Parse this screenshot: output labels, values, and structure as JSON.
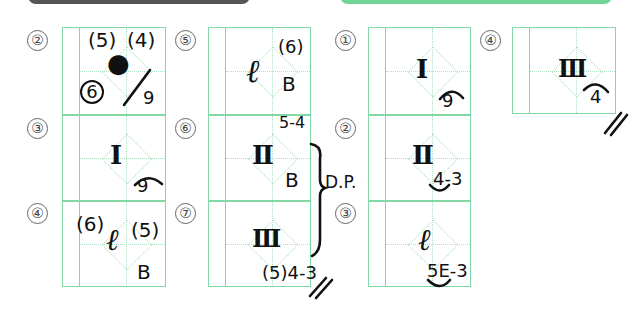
{
  "header_bars": {
    "left_color": "#555555",
    "right_color": "#6fd695"
  },
  "grid_color": "#7fd8a6",
  "left_answers": [
    {
      "number": "②",
      "main": "●",
      "top_left": "(5)",
      "top_right": "(4)",
      "circled": "6",
      "slash": "/",
      "bottom": "9"
    },
    {
      "number": "③",
      "main": "I",
      "bottom": "9",
      "arc": "⌒"
    },
    {
      "number": "④",
      "main": "ℓ",
      "left": "(6)",
      "right": "(5)",
      "bottom": "B"
    }
  ],
  "middle_answers": [
    {
      "number": "⑤",
      "main": "ℓ",
      "sup": "(6)",
      "sub": "B"
    },
    {
      "number": "⑥",
      "main": "Ⅱ",
      "sup": "5-4",
      "sub": "B"
    },
    {
      "number": "⑦",
      "main": "Ⅲ",
      "bottom": "(5)4-3",
      "end_mark": "//"
    },
    {
      "brace_label": "D.P."
    }
  ],
  "right_answers": [
    {
      "number": "①",
      "main": "I",
      "bottom": "9",
      "arc": "⌒"
    },
    {
      "number": "②",
      "main": "Ⅱ",
      "bottom": "4-3",
      "underarc": "◡"
    },
    {
      "number": "③",
      "main": "ℓ",
      "bottom": "5E-3",
      "underarc": "◡"
    }
  ],
  "far_right_answers": [
    {
      "number": "④",
      "main": "Ⅲ",
      "bottom": "4",
      "arc": "⌒",
      "end_mark": "//"
    }
  ]
}
